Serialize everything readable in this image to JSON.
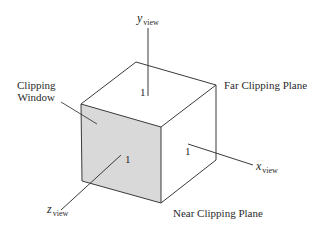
{
  "diagram": {
    "type": "normalized view volume cube",
    "colors": {
      "background": "#ffffff",
      "line": "#3a3a3a",
      "near_face_fill": "#d9d9d9",
      "text": "#2a2a2a"
    },
    "axes": {
      "y": {
        "symbol": "y",
        "subscript": "view",
        "unit_label": "1"
      },
      "x": {
        "symbol": "x",
        "subscript": "view",
        "unit_label": "1"
      },
      "z": {
        "symbol": "z",
        "subscript": "view",
        "unit_label": "1"
      }
    },
    "labels": {
      "clipping_window_line1": "Clipping",
      "clipping_window_line2": "Window",
      "far_clipping_plane": "Far Clipping Plane",
      "near_clipping_plane": "Near Clipping Plane"
    }
  }
}
